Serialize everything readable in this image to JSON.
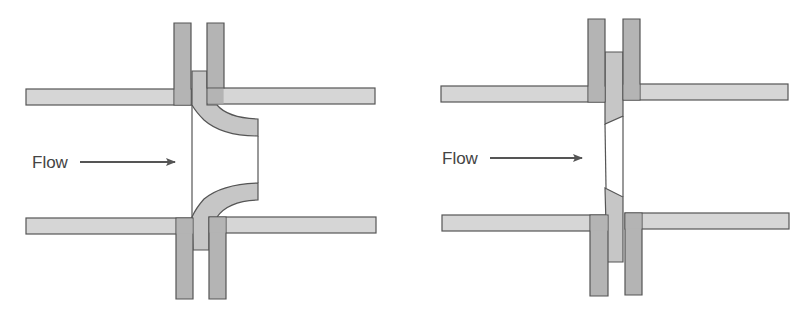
{
  "figure": {
    "colors": {
      "background": "#ffffff",
      "pipe_fill": "#d6d6d6",
      "flange_fill": "#b4b4b4",
      "insert_fill": "#c6c6c6",
      "outline": "#555555",
      "text": "#444444",
      "arrow": "#555555"
    },
    "diagrams": [
      {
        "id": "flow-nozzle",
        "description": "Flow nozzle installed between pipe flanges",
        "flow_label": "Flow",
        "flow_direction": "left-to-right"
      },
      {
        "id": "orifice-plate",
        "description": "Orifice plate installed between pipe flanges",
        "flow_label": "Flow",
        "flow_direction": "left-to-right"
      }
    ]
  }
}
